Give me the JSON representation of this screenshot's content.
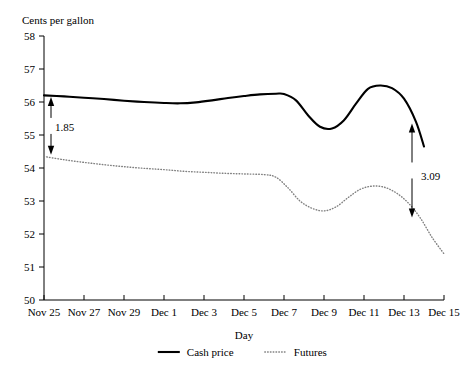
{
  "chart_data": {
    "type": "line",
    "title": "",
    "ylabel": "Cents per gallon",
    "xlabel": "Day",
    "ylim": [
      50,
      58
    ],
    "ytick_labels": [
      "50",
      "51",
      "52",
      "53",
      "54",
      "55",
      "56",
      "57",
      "58"
    ],
    "ytick_values": [
      50,
      51,
      52,
      53,
      54,
      55,
      56,
      57,
      58
    ],
    "xtick_labels": [
      "Nov 25",
      "Nov 27",
      "Nov 29",
      "Dec 1",
      "Dec 3",
      "Dec 5",
      "Dec 7",
      "Dec 9",
      "Dec 11",
      "Dec 13",
      "Dec 15"
    ],
    "xtick_values": [
      0,
      2,
      4,
      6,
      8,
      10,
      12,
      14,
      16,
      18,
      20
    ],
    "xlim": [
      0,
      20
    ],
    "grid": false,
    "legend_position": "bottom",
    "series": [
      {
        "name": "Cash price",
        "style": "solid",
        "color": "#000000",
        "x": [
          0,
          1,
          2,
          3,
          4,
          5,
          6,
          6.8,
          7.6,
          8.4,
          9.2,
          10,
          10.8,
          11.6,
          12,
          12.6,
          13.2,
          13.8,
          14.4,
          15,
          15.6,
          16.2,
          16.8,
          17.4,
          18,
          18.6,
          19
        ],
        "y": [
          56.2,
          56.17,
          56.13,
          56.09,
          56.04,
          56.0,
          55.97,
          55.96,
          55.99,
          56.05,
          56.12,
          56.18,
          56.23,
          56.25,
          56.24,
          56.05,
          55.6,
          55.25,
          55.2,
          55.45,
          55.95,
          56.4,
          56.5,
          56.42,
          56.1,
          55.4,
          54.65
        ]
      },
      {
        "name": "Futures",
        "style": "dotted",
        "color": "#808080",
        "x": [
          0,
          1,
          2,
          3,
          4,
          5,
          6,
          7,
          8,
          9,
          10,
          11,
          11.6,
          12.2,
          12.8,
          13.4,
          14,
          14.6,
          15.2,
          15.8,
          16.4,
          17,
          17.6,
          18.2,
          18.8,
          19.4,
          20
        ],
        "y": [
          54.35,
          54.25,
          54.17,
          54.1,
          54.04,
          53.99,
          53.95,
          53.9,
          53.87,
          53.84,
          53.82,
          53.8,
          53.72,
          53.4,
          53.0,
          52.78,
          52.7,
          52.82,
          53.1,
          53.35,
          53.45,
          53.42,
          53.25,
          52.95,
          52.5,
          51.9,
          51.4
        ]
      }
    ],
    "annotations": [
      {
        "label": "1.85",
        "type": "double-arrow-vertical",
        "x": 0.35,
        "y_top": 56.15,
        "y_bottom": 54.4,
        "label_x": 0.55,
        "label_y": 55.25
      },
      {
        "label": "3.09",
        "type": "double-arrow-vertical",
        "x": 18.4,
        "y_top": 55.35,
        "y_bottom": 52.5,
        "label_x": 18.85,
        "label_y": 53.75
      }
    ]
  }
}
